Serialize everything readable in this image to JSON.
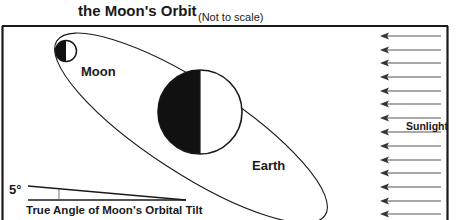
{
  "title": "the Moon's Orbit",
  "subtitle_note": "(Not to scale)",
  "bodies": {
    "moon": {
      "label": "Moon"
    },
    "earth": {
      "label": "Earth"
    }
  },
  "sunlight": {
    "label": "Sunlight",
    "arrow_count": 14,
    "direction": "right-to-left"
  },
  "tilt": {
    "angle_label": "5°",
    "caption": "True Angle of Moon's Orbital Tilt"
  },
  "colors": {
    "ink": "#1a1a1a",
    "shadow": "#111111",
    "arrow": "#555555",
    "background": "#ffffff"
  }
}
